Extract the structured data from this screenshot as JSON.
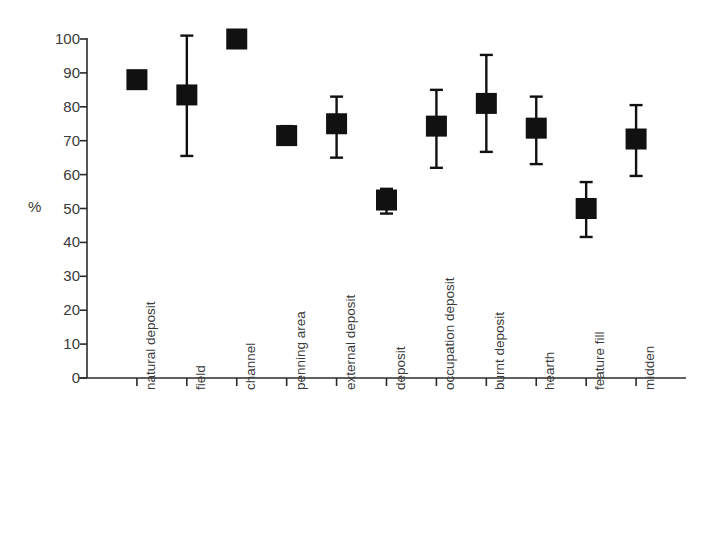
{
  "chart_data": {
    "type": "scatter",
    "title": "",
    "subtitle": "",
    "xlabel": "",
    "ylabel": "%",
    "ylim": [
      0,
      100
    ],
    "xlim": [
      0,
      12
    ],
    "grid": false,
    "legend": null,
    "yticks": [
      "0",
      "10",
      "20",
      "30",
      "40",
      "50",
      "60",
      "70",
      "80",
      "90",
      "100"
    ],
    "ytick_values": [
      0,
      10,
      20,
      30,
      40,
      50,
      60,
      70,
      80,
      90,
      100
    ],
    "categories": [
      "natural deposit",
      "field",
      "channel",
      "penning area",
      "external deposit",
      "deposit",
      "occupation deposit",
      "burnt deposit",
      "hearth",
      "feature fill",
      "midden"
    ],
    "values": [
      88,
      83.5,
      100,
      71.5,
      75,
      52.5,
      74.3,
      81,
      73.7,
      50,
      70.5
    ],
    "error_upper": [
      88,
      101,
      100,
      74.3,
      83,
      55.8,
      85,
      95.3,
      83,
      57.8,
      80.5
    ],
    "error_lower": [
      88,
      65.5,
      100,
      69.3,
      65,
      48.5,
      62,
      66.7,
      63.1,
      41.6,
      59.6
    ],
    "marker": "filled-square",
    "marker_color": "#111111",
    "errorbar_color": "#111111",
    "axis_color": "#2b2b2b"
  },
  "axes": {
    "y_unit_label": "%"
  }
}
